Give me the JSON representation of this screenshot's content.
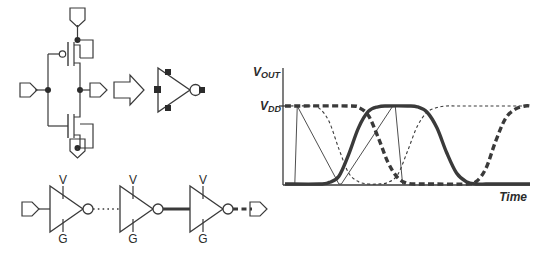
{
  "figure": {
    "title": "",
    "panels": [
      {
        "name": "cmos-inverter-schematic"
      },
      {
        "name": "inverter-symbol"
      },
      {
        "name": "inverter-chain"
      },
      {
        "name": "output-waveform-plot"
      }
    ]
  },
  "schematic": {
    "name": "cmos-inverter",
    "supply_port_label": "",
    "ground_port_label": "",
    "input_port_label": "",
    "output_port_label": "",
    "pmos_label": "",
    "nmos_label": "",
    "transform_arrow": "right-arrow"
  },
  "symbol": {
    "name": "inverter-symbol",
    "body": "triangle",
    "bubble": "inverting-bubble",
    "pins": [
      "supply-pin",
      "ground-pin",
      "input-pin",
      "output-pin"
    ]
  },
  "chain": {
    "stage_count": 3,
    "supply_label": "V",
    "ground_label": "G",
    "stages": [
      {
        "supply": "V",
        "ground": "G",
        "out_wire_style": "dotted"
      },
      {
        "supply": "V",
        "ground": "G",
        "out_wire_style": "thick-solid"
      },
      {
        "supply": "V",
        "ground": "G",
        "out_wire_style": "thick-dashed"
      }
    ],
    "input_port_label": "",
    "output_port_label": ""
  },
  "plot": {
    "y_axis_label": "V",
    "y_axis_label_sub": "OUT",
    "y_level_label": "V",
    "y_level_label_sub": "DD",
    "x_axis_label": "Time"
  },
  "colors": {
    "ink": "#3a3a3a",
    "ink_dark": "#2b2b2b",
    "background": "#ffffff"
  },
  "chart_data": {
    "type": "line",
    "title": "",
    "xlabel": "Time",
    "ylabel": "VOUT",
    "ylim": [
      0,
      1
    ],
    "xlim": [
      0,
      100
    ],
    "grid": false,
    "legend": "none",
    "y_tick_labels": [
      "VDD"
    ],
    "y_tick_values": [
      1
    ],
    "axes": {
      "y_at_x": 0,
      "x_at_y": 0
    },
    "series": [
      {
        "name": "stage-0-input-ramp",
        "style": "thin-solid",
        "comment": "steep falling input edges drawn as straight thin lines",
        "x": [
          4,
          5,
          22,
          23,
          44,
          45,
          48,
          49
        ],
        "y": [
          0,
          1,
          0,
          0,
          1,
          1,
          0,
          0
        ]
      },
      {
        "name": "stage-1-output",
        "style": "fine-dashed",
        "x": [
          0,
          10,
          14,
          18,
          22,
          26,
          30,
          34,
          38,
          42,
          46,
          50,
          54,
          58,
          62,
          66,
          70,
          74,
          78,
          100
        ],
        "y": [
          1,
          1,
          0.97,
          0.8,
          0.45,
          0.14,
          0.03,
          0.0,
          0.0,
          0.02,
          0.12,
          0.42,
          0.74,
          0.92,
          0.98,
          1.0,
          1.0,
          1.0,
          1.0,
          1.0
        ]
      },
      {
        "name": "stage-2-output",
        "style": "thick-solid",
        "x": [
          0,
          14,
          18,
          22,
          26,
          30,
          34,
          38,
          42,
          50,
          54,
          58,
          62,
          66,
          70,
          74,
          78,
          82,
          86,
          90,
          100
        ],
        "y": [
          0,
          0,
          0.02,
          0.1,
          0.38,
          0.72,
          0.93,
          0.99,
          1.0,
          1.0,
          0.99,
          0.92,
          0.72,
          0.4,
          0.14,
          0.03,
          0.0,
          0.0,
          0.0,
          0.0,
          0.0
        ]
      },
      {
        "name": "stage-3-output",
        "style": "thick-dashed",
        "x": [
          0,
          26,
          30,
          34,
          38,
          42,
          46,
          50,
          54,
          58,
          74,
          78,
          82,
          86,
          90,
          94,
          98,
          100
        ],
        "y": [
          1,
          1,
          0.98,
          0.88,
          0.6,
          0.28,
          0.08,
          0.01,
          0.0,
          0.0,
          0.0,
          0.03,
          0.2,
          0.55,
          0.84,
          0.96,
          1.0,
          1.0
        ]
      }
    ]
  }
}
